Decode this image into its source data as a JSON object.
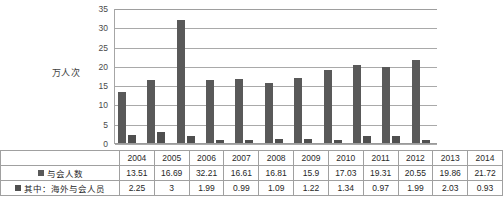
{
  "chart_data": {
    "type": "bar",
    "title": "",
    "xlabel": "",
    "ylabel": "万人次",
    "ylim": [
      0,
      35
    ],
    "yticks": [
      "0",
      "5",
      "10",
      "15",
      "20",
      "25",
      "30",
      "35"
    ],
    "grid": true,
    "legend_position": "table",
    "categories": [
      "2004",
      "2005",
      "2006",
      "2007",
      "2008",
      "2009",
      "2010",
      "2011",
      "2012",
      "2013",
      "2014"
    ],
    "series": [
      {
        "name": "与会人数",
        "swatch_color": "#595959",
        "values": [
          13.51,
          16.69,
          32.21,
          16.61,
          16.81,
          15.9,
          17.03,
          19.31,
          20.55,
          19.86,
          21.72
        ],
        "labels": [
          "13.51",
          "16.69",
          "32.21",
          "16.61",
          "16.81",
          "15.9",
          "17.03",
          "19.31",
          "20.55",
          "19.86",
          "21.72"
        ]
      },
      {
        "name": "其中：海外与会人员",
        "swatch_color": "#4f4f4f",
        "values": [
          2.25,
          3,
          1.99,
          0.99,
          1.09,
          1.22,
          1.34,
          0.97,
          1.99,
          2.03,
          0.93
        ],
        "labels": [
          "2.25",
          "3",
          "1.99",
          "0.99",
          "1.09",
          "1.22",
          "1.34",
          "0.97",
          "1.99",
          "2.03",
          "0.93"
        ]
      }
    ]
  },
  "table": {
    "corner_label": "",
    "year_header": [
      "2004",
      "2005",
      "2006",
      "2007",
      "2008",
      "2009",
      "2010",
      "2011",
      "2012",
      "2013",
      "2014"
    ],
    "rows": [
      {
        "label": "与会人数",
        "swatch": "legend-swatch-attendees",
        "values": [
          "13.51",
          "16.69",
          "32.21",
          "16.61",
          "16.81",
          "15.9",
          "17.03",
          "19.31",
          "20.55",
          "19.86",
          "21.72"
        ]
      },
      {
        "label": "其中：海外与会人员",
        "swatch": "legend-swatch-overseas",
        "values": [
          "2.25",
          "3",
          "1.99",
          "0.99",
          "1.09",
          "1.22",
          "1.34",
          "0.97",
          "1.99",
          "2.03",
          "0.93"
        ]
      }
    ]
  }
}
